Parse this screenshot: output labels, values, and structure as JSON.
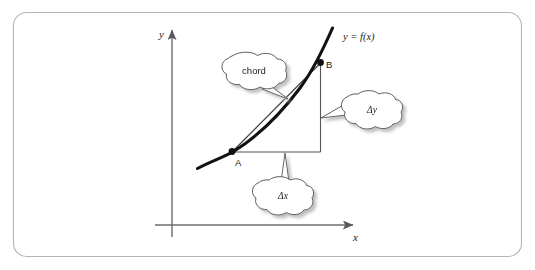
{
  "figure": {
    "background_color": "#ffffff",
    "border_color": "#b3b3b3",
    "curve_color": "#000000",
    "chord_color": "#444444",
    "axis_color": "#6e6e6e",
    "cloud_fill": "#ffffff",
    "cloud_stroke": "#555555",
    "shadow_color": "#c9c9c9"
  },
  "axes": {
    "y_label": "y",
    "x_label": "x"
  },
  "curve": {
    "function_label": "y = f(x)"
  },
  "points": [
    {
      "name": "A",
      "label": "A"
    },
    {
      "name": "B",
      "label": "B"
    }
  ],
  "callouts": [
    {
      "name": "chord",
      "text": "chord"
    },
    {
      "name": "delta-y",
      "text": "Δy"
    },
    {
      "name": "delta-x",
      "text": "Δx"
    }
  ]
}
